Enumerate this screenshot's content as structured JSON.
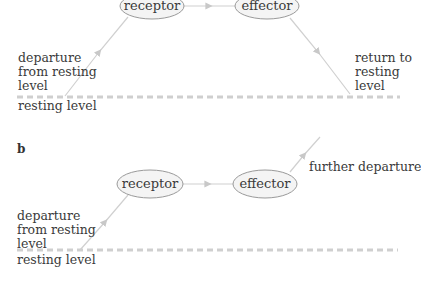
{
  "panel_a": {
    "letter": "a",
    "receptor": "receptor",
    "effector": "effector",
    "left_label": [
      "departure",
      "from resting",
      "level"
    ],
    "right_label": [
      "return to",
      "resting",
      "level"
    ],
    "baseline_label": "resting level"
  },
  "panel_b": {
    "letter": "b",
    "receptor": "receptor",
    "effector": "effector",
    "left_label": [
      "departure",
      "from resting",
      "level"
    ],
    "right_label": "further departure",
    "baseline_label": "resting level"
  },
  "colors": {
    "line": "#d0d0d0",
    "dash": "#cfcfcf",
    "ellipse_fill": "#f4f4f4",
    "ellipse_stroke": "#9a9a9a",
    "text": "#3a3a3a"
  }
}
